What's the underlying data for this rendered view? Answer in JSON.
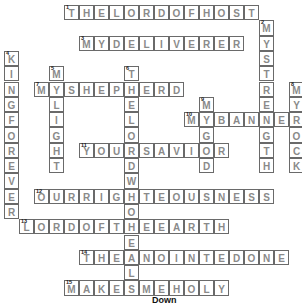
{
  "puzzle": {
    "grid": {
      "origin_x": 4,
      "origin_y": 5,
      "cell_w": 15,
      "cell_h": 15.3
    },
    "words": [
      {
        "number": 1,
        "direction": "across",
        "answer": "THELORDOFHOST",
        "row": 0,
        "col": 4
      },
      {
        "number": 2,
        "direction": "down",
        "answer": "MYSTRENGTH",
        "row": 1,
        "col": 17
      },
      {
        "number": 3,
        "direction": "across",
        "answer": "MYDELIVERER",
        "row": 2,
        "col": 5
      },
      {
        "number": 4,
        "direction": "down",
        "answer": "KINGFOREVER",
        "row": 3,
        "col": 0
      },
      {
        "number": 5,
        "direction": "down",
        "answer": "MYLIGHT",
        "row": 4,
        "col": 3
      },
      {
        "number": 6,
        "direction": "down",
        "answer": "THELORDWHOHEALS",
        "row": 4,
        "col": 8
      },
      {
        "number": 7,
        "direction": "across",
        "answer": "MYSHEPHERD",
        "row": 5,
        "col": 2
      },
      {
        "number": 8,
        "direction": "down",
        "answer": "MYROCK",
        "row": 5,
        "col": 19
      },
      {
        "number": 9,
        "direction": "down",
        "answer": "MYGOD",
        "row": 6,
        "col": 13
      },
      {
        "number": 10,
        "direction": "across",
        "answer": "MYBANNER",
        "row": 7,
        "col": 12
      },
      {
        "number": 11,
        "direction": "across",
        "answer": "YOURSAVIOR",
        "row": 9,
        "col": 5
      },
      {
        "number": 12,
        "direction": "across",
        "answer": "OURRIGHTEOUSNESS",
        "row": 12,
        "col": 2
      },
      {
        "number": 13,
        "direction": "across",
        "answer": "LORDOFTHEEARTH",
        "row": 14,
        "col": 1
      },
      {
        "number": 14,
        "direction": "across",
        "answer": "THEANOINTEDONE",
        "row": 16,
        "col": 5
      },
      {
        "number": 15,
        "direction": "across",
        "answer": "MAKESMEHOLY",
        "row": 18,
        "col": 4
      }
    ]
  },
  "clues": {
    "down_heading": "Down"
  },
  "colors": {
    "cell_border": "#6a6a6a",
    "letter": "#8a8a8a",
    "number": "#222222"
  }
}
